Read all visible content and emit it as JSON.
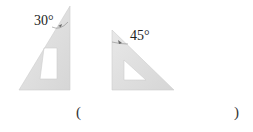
{
  "figures": [
    {
      "name": "set-square-30",
      "angle_label": "30°"
    },
    {
      "name": "set-square-45",
      "angle_label": "45°"
    }
  ],
  "answer": {
    "open": "(",
    "close": ")",
    "value": ""
  },
  "colors": {
    "fill": "#dcdcdc",
    "stroke": "#cfcfcf",
    "text": "#222222"
  }
}
